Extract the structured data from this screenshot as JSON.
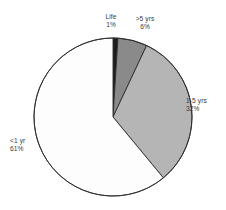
{
  "chart_data": {
    "type": "pie",
    "title": "",
    "subtitle": "",
    "xlabel": "",
    "ylabel": "",
    "legend_position": "none",
    "grid": false,
    "labels_show_percent": true,
    "categories": [
      "Life",
      ">5 yrs",
      "1-5 yrs",
      "<1 yr"
    ],
    "values": [
      1,
      6,
      32,
      61
    ],
    "unit": "%",
    "slices": [
      {
        "name": "Life",
        "percent_label": "1%",
        "value": 1,
        "color": "#1c1c1c",
        "stroke": "#2b2b2b",
        "start_angle": 0,
        "end_angle": 3.6,
        "label_position": "top"
      },
      {
        "name": ">5 yrs",
        "percent_label": "6%",
        "value": 6,
        "color": "#8a8a8a",
        "stroke": "#2b2b2b",
        "start_angle": 3.6,
        "end_angle": 25.2,
        "label_position": "top-right"
      },
      {
        "name": "1-5 yrs",
        "percent_label": "32%",
        "value": 32,
        "color": "#b5b5b5",
        "stroke": "#2b2b2b",
        "start_angle": 25.2,
        "end_angle": 140.4,
        "label_position": "right"
      },
      {
        "name": "<1 yr",
        "percent_label": "61%",
        "value": 61,
        "color": "#fdfdfd",
        "stroke": "#2b2b2b",
        "start_angle": 140.4,
        "end_angle": 360,
        "label_position": "left"
      }
    ],
    "geometry": {
      "center_x": 113,
      "center_y": 117,
      "radius": 79
    },
    "background_color": "#ffffff",
    "text_color": "#3a3a3a"
  }
}
